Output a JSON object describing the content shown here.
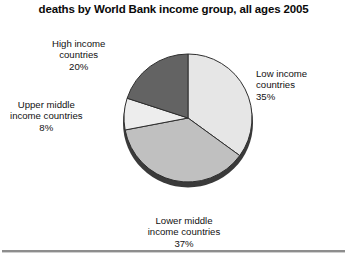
{
  "chart": {
    "title": "deaths by World Bank income group, all ages 2005"
  },
  "labels": {
    "high": {
      "line1": "High income",
      "line2": "countries",
      "line3": "20%"
    },
    "upper": {
      "line1": "Upper middle",
      "line2": "income countries",
      "line3": "8%"
    },
    "low": {
      "line1": "Low income",
      "line2": "countries",
      "line3": "35%"
    },
    "lower": {
      "line1": "Lower middle",
      "line2": "income countries",
      "line3": "37%"
    }
  },
  "chart_data": {
    "type": "pie",
    "title": "deaths by World Bank income group, all ages 2005",
    "xlabel": "",
    "ylabel": "",
    "unit": "percent",
    "legend_position": "none-callout-labels",
    "grid": false,
    "start_angle_deg": 0,
    "direction": "clockwise",
    "categories": [
      "Low income countries",
      "Lower middle income countries",
      "Upper middle income countries",
      "High income countries"
    ],
    "values": [
      35,
      37,
      8,
      20
    ],
    "value_labels": [
      "35%",
      "37%",
      "8%",
      "20%"
    ],
    "colors": [
      "#e6e6e6",
      "#c0c0c0",
      "#ededed",
      "#636363"
    ],
    "slices": [
      {
        "name": "Low income countries",
        "value": 35,
        "label": "35%",
        "color": "#e6e6e6",
        "start_deg": 0,
        "end_deg": 126
      },
      {
        "name": "Lower middle income countries",
        "value": 37,
        "label": "37%",
        "color": "#c0c0c0",
        "start_deg": 126,
        "end_deg": 259.2
      },
      {
        "name": "Upper middle income countries",
        "value": 8,
        "label": "8%",
        "color": "#ededed",
        "start_deg": 259.2,
        "end_deg": 288
      },
      {
        "name": "High income countries",
        "value": 20,
        "label": "20%",
        "color": "#636363",
        "start_deg": 288,
        "end_deg": 360
      }
    ],
    "total": 100
  }
}
